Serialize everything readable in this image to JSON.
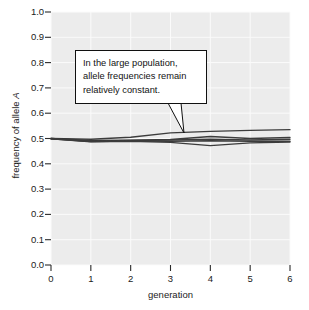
{
  "chart_data": {
    "type": "line",
    "title": "",
    "xlabel": "generation",
    "ylabel": "frequency of allele A",
    "xlim": [
      0,
      6
    ],
    "ylim": [
      0.0,
      1.0
    ],
    "xticks": [
      "0",
      "1",
      "2",
      "3",
      "4",
      "5",
      "6"
    ],
    "yticks": [
      "0.0",
      "0.1",
      "0.2",
      "0.3",
      "0.4",
      "0.5",
      "0.6",
      "0.7",
      "0.8",
      "0.9",
      "1.0"
    ],
    "grid": true,
    "legend": "none",
    "x": [
      0,
      1,
      2,
      3,
      4,
      5,
      6
    ],
    "series": [
      {
        "name": "population 1",
        "values": [
          0.5,
          0.497,
          0.505,
          0.522,
          0.528,
          0.532,
          0.535
        ]
      },
      {
        "name": "population 2",
        "values": [
          0.5,
          0.492,
          0.493,
          0.496,
          0.508,
          0.5,
          0.504
        ]
      },
      {
        "name": "population 3",
        "values": [
          0.5,
          0.489,
          0.492,
          0.494,
          0.497,
          0.494,
          0.497
        ]
      },
      {
        "name": "population 4",
        "values": [
          0.499,
          0.488,
          0.49,
          0.489,
          0.491,
          0.489,
          0.489
        ]
      },
      {
        "name": "population 5",
        "values": [
          0.499,
          0.487,
          0.489,
          0.485,
          0.472,
          0.483,
          0.486
        ]
      }
    ],
    "annotations": [
      {
        "name": "large-population-callout",
        "lines": [
          "In the large population,",
          "allele frequencies remain",
          "relatively constant."
        ],
        "points_to": {
          "x": 3.35,
          "y": 0.525
        }
      }
    ],
    "colors": {
      "panel_background": "#ececec",
      "gridline": "#fbfbfb",
      "line": "#3c3c3c",
      "axis": "#2b2b2b",
      "text": "#1b1b1b",
      "page_background": "#ffffff",
      "callout_fill": "#ffffff",
      "callout_border": "#101010"
    }
  }
}
